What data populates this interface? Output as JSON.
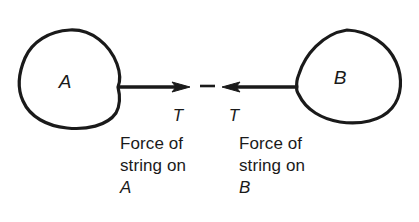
{
  "figure": {
    "background_color": "#ffffff",
    "ink_color": "#1a1a1a",
    "width": 419,
    "height": 222
  },
  "bodies": [
    {
      "id": "A",
      "label": "A",
      "side": "left",
      "center_x": 70,
      "center_y": 79,
      "attach_x": 118,
      "attach_y": 88
    },
    {
      "id": "B",
      "label": "B",
      "side": "right",
      "center_x": 348,
      "center_y": 76,
      "attach_x": 297,
      "attach_y": 88
    }
  ],
  "string": {
    "name": "string",
    "y": 87,
    "left_start_x": 118,
    "left_arrow_tip_x": 190,
    "right_start_x": 297,
    "right_arrow_tip_x": 222,
    "gap_dash": {
      "start_x": 200,
      "end_x": 215,
      "y": 86
    }
  },
  "force_labels": {
    "left": {
      "symbol": "T",
      "x": 172,
      "y": 119
    },
    "right": {
      "symbol": "T",
      "x": 229,
      "y": 119
    }
  },
  "captions": {
    "left": {
      "line1": "Force of",
      "line2": "string on",
      "line3": "A"
    },
    "right": {
      "line1": "Force of",
      "line2": "string on",
      "line3": "B"
    }
  }
}
